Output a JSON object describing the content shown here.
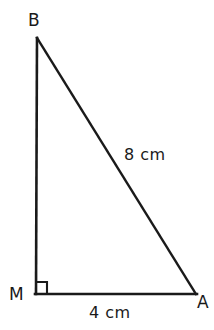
{
  "figure": {
    "kind": "right-triangle-diagram",
    "background_color": "#ffffff",
    "stroke_color": "#1a1a1a",
    "stroke_width": 2.5,
    "canvas": {
      "width": 214,
      "height": 330
    }
  },
  "vertices": [
    {
      "id": "B",
      "label": "B",
      "x": 37,
      "y": 38,
      "label_x": 28,
      "label_y": 12
    },
    {
      "id": "M",
      "label": "M",
      "x": 36,
      "y": 294,
      "label_x": 9,
      "label_y": 286
    },
    {
      "id": "A",
      "label": "A",
      "x": 196,
      "y": 294,
      "label_x": 197,
      "label_y": 294
    }
  ],
  "sides": [
    {
      "id": "BM",
      "from": "B",
      "to": "M",
      "label": "",
      "kind": "leg-vertical"
    },
    {
      "id": "MA",
      "from": "M",
      "to": "A",
      "label": "4 cm",
      "kind": "leg-horizontal"
    },
    {
      "id": "BA",
      "from": "B",
      "to": "A",
      "label": "8 cm",
      "kind": "hypotenuse"
    }
  ],
  "measures": {
    "hypotenuse": {
      "value": 8,
      "unit": "cm",
      "text": "8 cm"
    },
    "base": {
      "value": 4,
      "unit": "cm",
      "text": "4 cm"
    }
  },
  "right_angle": {
    "at_vertex": "M",
    "marker": "square",
    "size": 11,
    "description": "right-angle-marker"
  }
}
